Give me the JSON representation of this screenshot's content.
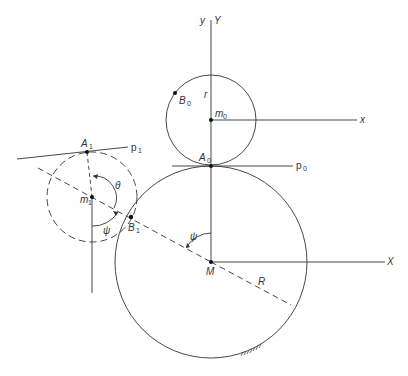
{
  "diagram": {
    "type": "geometry",
    "labels": {
      "y_axis_small": "y",
      "y_axis_big": "Y",
      "x_axis_small": "x",
      "x_axis_big": "X",
      "r": "r",
      "R": "R",
      "m0": "m",
      "m0_sub": "0",
      "m1": "m",
      "m1_sub": "1",
      "B0": "B",
      "B0_sub": "0",
      "B1": "B",
      "B1_sub": "1",
      "A0": "A",
      "A0_sub": "0",
      "A1": "A",
      "A1_sub": "1",
      "p0": "p",
      "p0_sub": "0",
      "p1": "p",
      "p1_sub": "1",
      "M": "M",
      "theta": "θ",
      "psi1": "ψ",
      "psi2": "ψ"
    },
    "colors": {
      "line": "#333333"
    }
  }
}
